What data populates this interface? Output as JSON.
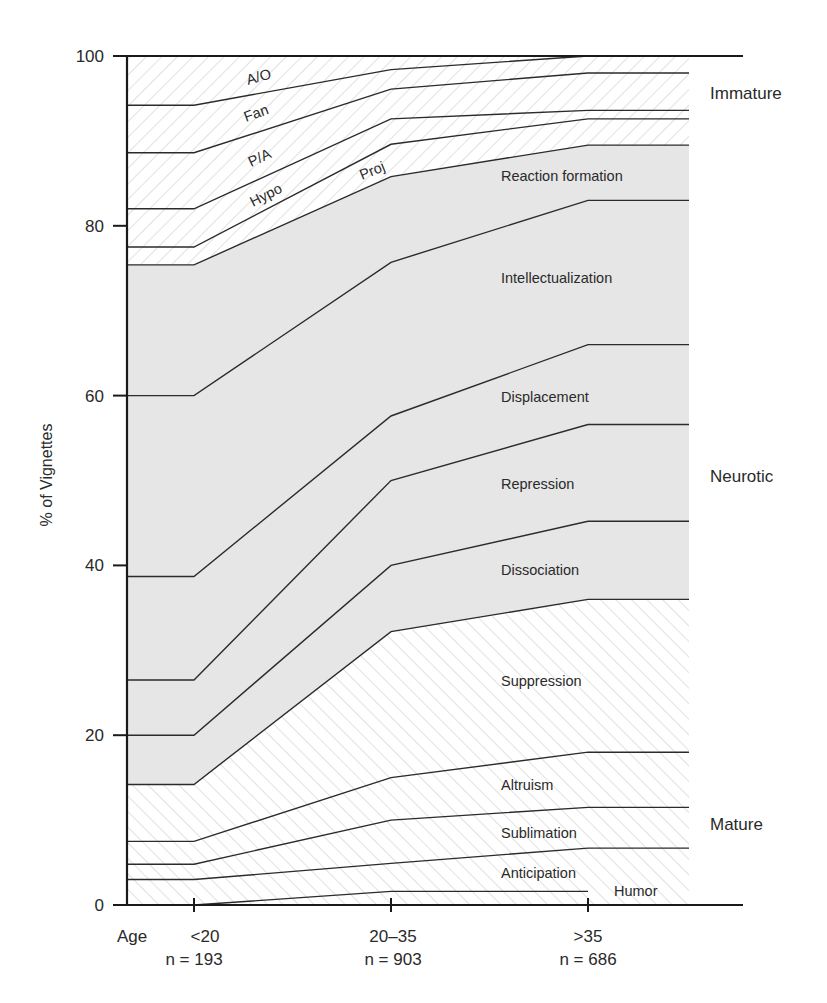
{
  "chart_data": {
    "type": "area",
    "title": "",
    "xlabel": "Age",
    "ylabel": "% of Vignettes",
    "ylim": [
      0,
      100
    ],
    "yticks": [
      0,
      20,
      40,
      60,
      80,
      100
    ],
    "grid": false,
    "categories": [
      "<20",
      "20–35",
      ">35"
    ],
    "sample_sizes": [
      "n = 193",
      "n = 903",
      "n = 686"
    ],
    "cumulative_upper_bounds": [
      {
        "name": "Humor",
        "group": "Mature",
        "values": [
          0,
          1.6,
          1.6
        ]
      },
      {
        "name": "Anticipation",
        "group": "Mature",
        "values": [
          3,
          4.9,
          6.7
        ]
      },
      {
        "name": "Sublimation",
        "group": "Mature",
        "values": [
          4.8,
          10,
          11.5
        ]
      },
      {
        "name": "Altruism",
        "group": "Mature",
        "values": [
          7.5,
          15,
          18
        ]
      },
      {
        "name": "Suppression",
        "group": "Mature",
        "values": [
          14.2,
          32.2,
          36
        ]
      },
      {
        "name": "Dissociation",
        "group": "Neurotic",
        "values": [
          20,
          40,
          45.2
        ]
      },
      {
        "name": "Repression",
        "group": "Neurotic",
        "values": [
          26.5,
          50,
          56.6
        ]
      },
      {
        "name": "Displacement",
        "group": "Neurotic",
        "values": [
          38.7,
          57.6,
          66
        ]
      },
      {
        "name": "Intellectualization",
        "group": "Neurotic",
        "values": [
          60,
          75.7,
          83
        ]
      },
      {
        "name": "Reaction formation",
        "group": "Neurotic",
        "values": [
          75.4,
          85.8,
          89.5
        ]
      },
      {
        "name": "Proj",
        "group": "Immature",
        "values": [
          77.5,
          89.6,
          92.6
        ]
      },
      {
        "name": "Hypo",
        "group": "Immature",
        "values": [
          82,
          92.6,
          93.6
        ]
      },
      {
        "name": "P/A",
        "group": "Immature",
        "values": [
          88.6,
          96.1,
          98
        ]
      },
      {
        "name": "Fan",
        "group": "Immature",
        "values": [
          94.2,
          98.4,
          100
        ]
      },
      {
        "name": "A/O",
        "group": "Immature",
        "values": [
          100,
          100,
          100
        ]
      }
    ],
    "series": [
      {
        "name": "Humor",
        "values": [
          0,
          1.6,
          1.6
        ]
      },
      {
        "name": "Anticipation",
        "values": [
          3,
          3.3,
          5.1
        ]
      },
      {
        "name": "Sublimation",
        "values": [
          1.8,
          5.1,
          4.8
        ]
      },
      {
        "name": "Altruism",
        "values": [
          2.7,
          5,
          6.5
        ]
      },
      {
        "name": "Suppression",
        "values": [
          6.7,
          17.2,
          18
        ]
      },
      {
        "name": "Dissociation",
        "values": [
          5.8,
          7.8,
          9.2
        ]
      },
      {
        "name": "Repression",
        "values": [
          6.5,
          10,
          11.4
        ]
      },
      {
        "name": "Displacement",
        "values": [
          12.2,
          7.6,
          9.4
        ]
      },
      {
        "name": "Intellectualization",
        "values": [
          21.3,
          18.1,
          17
        ]
      },
      {
        "name": "Reaction formation",
        "values": [
          15.4,
          10.1,
          6.5
        ]
      },
      {
        "name": "Proj",
        "values": [
          2.1,
          3.8,
          3.1
        ]
      },
      {
        "name": "Hypo",
        "values": [
          4.5,
          3,
          1
        ]
      },
      {
        "name": "P/A",
        "values": [
          6.6,
          3.5,
          4.4
        ]
      },
      {
        "name": "Fan",
        "values": [
          5.6,
          2.3,
          2
        ]
      },
      {
        "name": "A/O",
        "values": [
          5.8,
          1.6,
          0
        ]
      }
    ],
    "groups": [
      {
        "name": "Immature",
        "fill": "hatched-backslash"
      },
      {
        "name": "Neurotic",
        "fill": "light-gray"
      },
      {
        "name": "Mature",
        "fill": "hatched-slash"
      }
    ],
    "legend_position": "right (group labels)"
  },
  "labels": {
    "y_axis_title": "% of Vignettes",
    "x_axis_prefix": "Age",
    "y_ticks": [
      "0",
      "20",
      "40",
      "60",
      "80",
      "100"
    ],
    "x_ticks": [
      "<20",
      "20–35",
      ">35"
    ],
    "x_n": [
      "n = 193",
      "n = 903",
      "n = 686"
    ],
    "groups": {
      "immature": "Immature",
      "neurotic": "Neurotic",
      "mature": "Mature"
    },
    "areas": {
      "ao": "A/O",
      "fan": "Fan",
      "pa": "P/A",
      "hypo": "Hypo",
      "proj": "Proj",
      "reaction": "Reaction formation",
      "intellect": "Intellectualization",
      "displacement": "Displacement",
      "repression": "Repression",
      "dissociation": "Dissociation",
      "suppression": "Suppression",
      "altruism": "Altruism",
      "sublimation": "Sublimation",
      "anticipation": "Anticipation",
      "humor": "Humor"
    }
  },
  "colors": {
    "neurotic_fill": "#e6e6e6",
    "hatch_stroke": "#bdbdbd",
    "line": "#2b2b2b",
    "text": "#2a2a2a"
  }
}
